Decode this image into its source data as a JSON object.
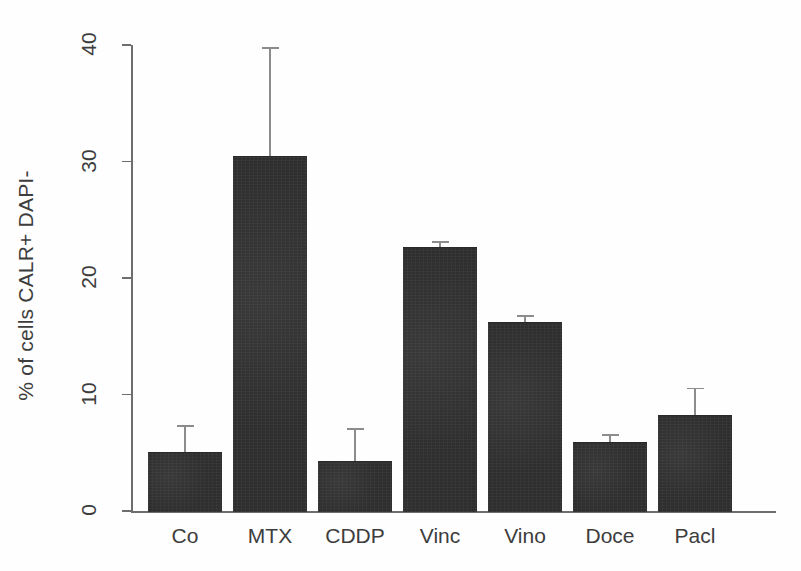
{
  "chart_data": {
    "type": "bar",
    "title": "",
    "xlabel": "",
    "ylabel": "% of cells CALR+ DAPI-",
    "categories": [
      "Co",
      "MTX",
      "CDDP",
      "Vinc",
      "Vino",
      "Doce",
      "Pacl"
    ],
    "values": [
      5.1,
      30.5,
      4.3,
      22.7,
      16.2,
      5.9,
      8.2
    ],
    "errors": [
      2.3,
      9.3,
      2.8,
      0.5,
      0.6,
      0.7,
      2.4
    ],
    "error_type": "upper-only",
    "ylim": [
      0,
      40
    ],
    "yticks": [
      0,
      10,
      20,
      30,
      40
    ],
    "ytick_labels": [
      "0",
      "10",
      "20",
      "30",
      "40"
    ],
    "grid": false,
    "legend": false,
    "bar_color": "#2e2e2e",
    "error_color": "#8c8c8c",
    "axis_color": "#6d6d6d",
    "tick_label_rotation": 90
  },
  "axis": {
    "y_label": "% of cells CALR+ DAPI-"
  }
}
